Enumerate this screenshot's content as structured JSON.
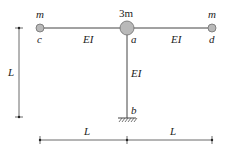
{
  "figure": {
    "kind": "structural-frame",
    "colors": {
      "line": "#444444",
      "mass_fill": "#b9b9b9",
      "mass_stroke": "#6f6f6f",
      "text": "#222222"
    },
    "nodes": {
      "c": {
        "label": "c",
        "mass_label": "m"
      },
      "a": {
        "label": "a",
        "mass_label": "3m"
      },
      "d": {
        "label": "d",
        "mass_label": "m"
      },
      "b": {
        "label": "b",
        "support": "fixed"
      }
    },
    "members": {
      "beam_left": {
        "from": "c",
        "to": "a",
        "stiffness_label": "EI"
      },
      "beam_right": {
        "from": "a",
        "to": "d",
        "stiffness_label": "EI"
      },
      "column": {
        "from": "a",
        "to": "b",
        "stiffness_label": "EI"
      }
    },
    "dimensions": {
      "vertical": {
        "label": "L"
      },
      "bottom_left": {
        "label": "L"
      },
      "bottom_right": {
        "label": "L"
      }
    }
  }
}
